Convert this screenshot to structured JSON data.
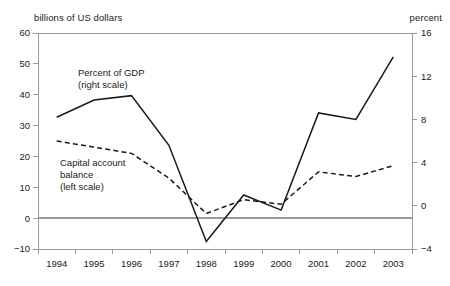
{
  "chart_data": {
    "type": "line",
    "title": "",
    "subtitle": "",
    "xlabel": "",
    "ylabel": "billions of US dollars",
    "y2label": "percent",
    "categories": [
      "1994",
      "1995",
      "1996",
      "1997",
      "1998",
      "1999",
      "2000",
      "2001",
      "2002",
      "2003"
    ],
    "x": [
      1994,
      1995,
      1996,
      1997,
      1998,
      1999,
      2000,
      2001,
      2002,
      2003
    ],
    "ylim": [
      -10,
      60
    ],
    "y2lim": [
      -4,
      16
    ],
    "yticks": [
      "60",
      "50",
      "40",
      "30",
      "20",
      "10",
      "0",
      "-10"
    ],
    "ytick_values": [
      60,
      50,
      40,
      30,
      20,
      10,
      0,
      -10
    ],
    "y2ticks": [
      "16",
      "12",
      "8",
      "4",
      "0",
      "-4"
    ],
    "y2tick_values": [
      16,
      12,
      8,
      4,
      0,
      -4
    ],
    "grid": false,
    "legend_position": "inside-annotations",
    "zero_line": true,
    "series": [
      {
        "name": "Percent of GDP",
        "axis": "right",
        "style": "solid",
        "color": "#1a1a1a",
        "values": [
          8.2,
          9.8,
          10.2,
          5.6,
          -3.3,
          1.0,
          -0.4,
          8.6,
          8.0,
          13.8
        ]
      },
      {
        "name": "Capital account balance",
        "axis": "left",
        "style": "dashed",
        "color": "#1a1a1a",
        "values": [
          25.0,
          23.0,
          21.0,
          13.0,
          1.5,
          6.0,
          4.5,
          15.0,
          13.5,
          17.0
        ]
      }
    ],
    "annotations": [
      {
        "name": "percent-of-gdp-label",
        "lines": [
          "Percent of GDP",
          "(right scale)"
        ],
        "x": 78,
        "y": 76
      },
      {
        "name": "capital-account-label",
        "lines": [
          "Capital account",
          "balance",
          "(left scale)"
        ],
        "x": 60,
        "y": 166
      }
    ]
  },
  "axes": {
    "left_title": "billions of US dollars",
    "right_title": "percent"
  },
  "colors": {
    "line": "#1a1a1a",
    "frame": "#9a9a9a",
    "zero_line": "#9a9a9a",
    "background": "#ffffff"
  }
}
